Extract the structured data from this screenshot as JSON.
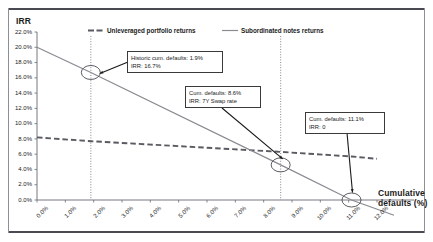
{
  "chart_data": {
    "type": "line",
    "title": "",
    "ylabel": "IRR",
    "xlabel": "Cumulative defaults (%)",
    "xlabel_line1": "Cumulative",
    "xlabel_line2": "defaults (%)",
    "xlim": [
      0,
      12
    ],
    "ylim": [
      0,
      22
    ],
    "xticks": [
      "0.0%",
      "1.0%",
      "2.0%",
      "3.0%",
      "4.0%",
      "5.0%",
      "6.0%",
      "7.0%",
      "8.0%",
      "9.0%",
      "10.0%",
      "11.0%",
      "12.0%"
    ],
    "xtick_values": [
      0,
      1,
      2,
      3,
      4,
      5,
      6,
      7,
      8,
      9,
      10,
      11,
      12
    ],
    "yticks": [
      "0.0%",
      "2.0%",
      "4.0%",
      "6.0%",
      "8.0%",
      "10.0%",
      "12.0%",
      "14.0%",
      "16.0%",
      "18.0%",
      "20.0%",
      "22.0%"
    ],
    "ytick_values": [
      0,
      2,
      4,
      6,
      8,
      10,
      12,
      14,
      16,
      18,
      20,
      22
    ],
    "grid": false,
    "legend_position": "top",
    "series": [
      {
        "name": "Unleveraged portfolio returns",
        "style": "dashed",
        "color": "#5a5a62",
        "x": [
          0,
          1.9,
          8.6,
          11.1,
          12
        ],
        "values": [
          8.2,
          7.7,
          6.3,
          5.7,
          5.4
        ]
      },
      {
        "name": "Subordinated notes returns",
        "style": "solid",
        "color": "#8a8a92",
        "x": [
          0,
          1.9,
          8.6,
          11.1,
          12.6
        ],
        "values": [
          20.0,
          16.7,
          4.6,
          0.0,
          -2.0
        ]
      }
    ],
    "markers": [
      {
        "x": 1.9,
        "y": 16.7,
        "shape": "ellipse"
      },
      {
        "x": 8.6,
        "y": 4.6,
        "shape": "ellipse"
      },
      {
        "x": 11.1,
        "y": 0.0,
        "shape": "ellipse"
      }
    ],
    "vertical_guides": [
      1.9,
      8.6
    ],
    "annotations": [
      {
        "id": "historic",
        "line1": "Historic cum. defaults: 1.9%",
        "line2": "IRR: 16.7%",
        "target_x": 1.9,
        "target_y": 16.7
      },
      {
        "id": "swap",
        "line1": "Cum. defaults: 8.6%",
        "line2": "IRR: 7Y Swap rate",
        "target_x": 8.6,
        "target_y": 4.6
      },
      {
        "id": "zero",
        "line1": "Cum. defaults: 11.1%",
        "line2": "IRR: 0",
        "target_x": 11.1,
        "target_y": 0.0
      }
    ]
  },
  "legend": {
    "items": [
      {
        "label": "Unleveraged portfolio returns"
      },
      {
        "label": "Subordinated notes returns"
      }
    ]
  }
}
